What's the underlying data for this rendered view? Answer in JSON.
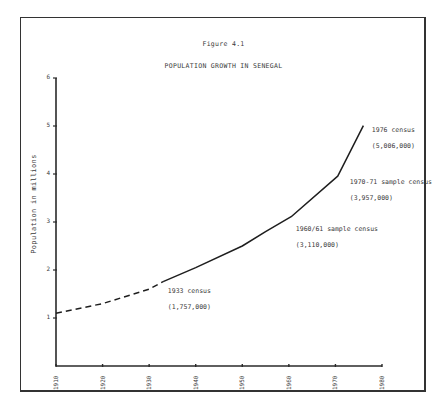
{
  "figure": {
    "label": "Figure 4.1",
    "title": "POPULATION GROWTH IN SENEGAL"
  },
  "chart_data": {
    "type": "line",
    "title": "POPULATION GROWTH IN SENEGAL",
    "subtitle": "Figure 4.1",
    "xlabel": "",
    "ylabel": "Population in millions",
    "xlim": [
      1910,
      1980
    ],
    "ylim": [
      0,
      6
    ],
    "x_ticks": [
      "1910",
      "1920",
      "1930",
      "1940",
      "1950",
      "1960",
      "1970",
      "1980"
    ],
    "y_ticks": [
      "1",
      "2",
      "3",
      "4",
      "5",
      "6"
    ],
    "grid": false,
    "series": [
      {
        "name": "Estimated (dashed)",
        "style": "dashed",
        "x": [
          1910,
          1920,
          1930,
          1933
        ],
        "y": [
          1.1,
          1.3,
          1.6,
          1.757
        ]
      },
      {
        "name": "Census-based (solid)",
        "style": "solid",
        "x": [
          1933,
          1940,
          1950,
          1955,
          1960.5,
          1970.5,
          1976
        ],
        "y": [
          1.757,
          2.05,
          2.5,
          2.8,
          3.11,
          3.957,
          5.006
        ]
      }
    ],
    "annotations": [
      {
        "x": 1933,
        "y": 1.757,
        "text": "1933 census",
        "value": "(1,757,000)"
      },
      {
        "x": 1960.5,
        "y": 3.11,
        "text": "1960/61 sample census",
        "value": "(3,110,000)"
      },
      {
        "x": 1970.5,
        "y": 3.957,
        "text": "1970-71 sample census",
        "value": "(3,957,000)"
      },
      {
        "x": 1976,
        "y": 5.006,
        "text": "1976 census",
        "value": "(5,006,000)"
      }
    ]
  }
}
